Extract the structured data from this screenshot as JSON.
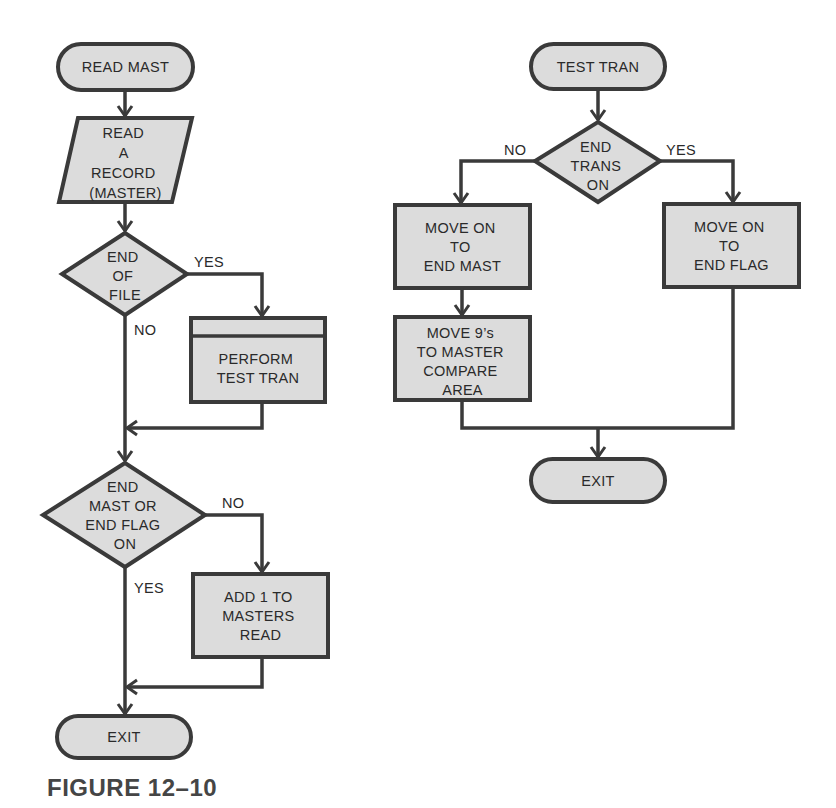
{
  "figure": {
    "caption": "FIGURE 12–10"
  },
  "left_flow": {
    "start": {
      "label": "READ MAST"
    },
    "read_record": {
      "lines": [
        "READ",
        "A",
        "RECORD",
        "(MASTER)"
      ]
    },
    "decision_eof": {
      "lines": [
        "END",
        "OF",
        "FILE"
      ],
      "yes_label": "YES",
      "no_label": "NO"
    },
    "perform": {
      "lines": [
        "PERFORM",
        "TEST TRAN"
      ]
    },
    "decision_end": {
      "lines": [
        "END",
        "MAST OR",
        "END FLAG",
        "ON"
      ],
      "yes_label": "YES",
      "no_label": "NO"
    },
    "add_one": {
      "lines": [
        "ADD 1 TO",
        "MASTERS",
        "READ"
      ]
    },
    "exit": {
      "label": "EXIT"
    }
  },
  "right_flow": {
    "start": {
      "label": "TEST TRAN"
    },
    "decision_trans": {
      "lines": [
        "END",
        "TRANS",
        "ON"
      ],
      "yes_label": "YES",
      "no_label": "NO"
    },
    "move_end_mast": {
      "lines": [
        "MOVE ON",
        "TO",
        "END MAST"
      ]
    },
    "move_nines": {
      "lines": [
        "MOVE 9’s",
        "TO MASTER",
        "COMPARE",
        "AREA"
      ]
    },
    "move_end_flag": {
      "lines": [
        "MOVE ON",
        "TO",
        "END FLAG"
      ]
    },
    "exit": {
      "label": "EXIT"
    }
  },
  "colors": {
    "shape_fill": "#dcdcdc",
    "stroke": "#3a3a3a",
    "text": "#2a2a2a",
    "background": "#ffffff"
  }
}
